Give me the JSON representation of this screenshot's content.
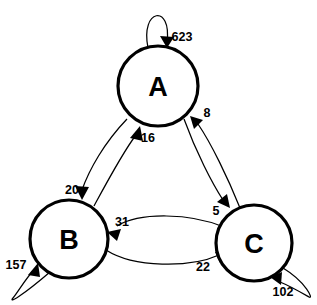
{
  "diagram": {
    "type": "state-transition-diagram",
    "title": "",
    "background_color": "#ffffff",
    "stroke_color": "#000000",
    "nodes": [
      {
        "id": "A",
        "label": "A",
        "cx": 158,
        "cy": 86,
        "r": 40
      },
      {
        "id": "B",
        "label": "B",
        "cx": 69,
        "cy": 239,
        "r": 39
      },
      {
        "id": "C",
        "label": "C",
        "cx": 254,
        "cy": 243,
        "r": 38
      }
    ],
    "edges": [
      {
        "id": "A-A",
        "from": "A",
        "to": "A",
        "label": "623",
        "kind": "self-loop",
        "label_x": 182,
        "label_y": 37
      },
      {
        "id": "B-B",
        "from": "B",
        "to": "B",
        "label": "157",
        "kind": "self-loop",
        "label_x": 16,
        "label_y": 265
      },
      {
        "id": "C-C",
        "from": "C",
        "to": "C",
        "label": "102",
        "kind": "self-loop",
        "label_x": 283,
        "label_y": 292
      },
      {
        "id": "A-B",
        "from": "A",
        "to": "B",
        "label": "20",
        "kind": "curved",
        "label_x": 72,
        "label_y": 190
      },
      {
        "id": "B-A",
        "from": "B",
        "to": "A",
        "label": "16",
        "kind": "curved",
        "label_x": 148,
        "label_y": 138
      },
      {
        "id": "A-C",
        "from": "A",
        "to": "C",
        "label": "5",
        "kind": "curved",
        "label_x": 216,
        "label_y": 211
      },
      {
        "id": "C-A",
        "from": "C",
        "to": "A",
        "label": "8",
        "kind": "curved",
        "label_x": 207,
        "label_y": 113
      },
      {
        "id": "C-B",
        "from": "C",
        "to": "B",
        "label": "31",
        "kind": "curved",
        "label_x": 122,
        "label_y": 222
      },
      {
        "id": "B-C",
        "from": "B",
        "to": "C",
        "label": "22",
        "kind": "curved",
        "label_x": 203,
        "label_y": 267
      }
    ]
  }
}
